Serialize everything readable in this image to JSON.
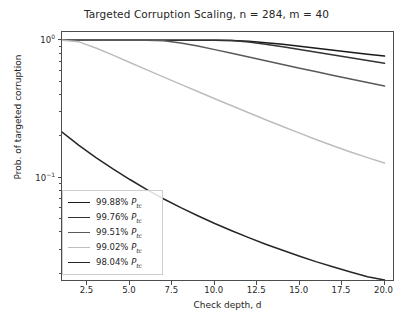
{
  "chart_data": {
    "type": "line",
    "title": "Targeted Corruption Scaling, n = 284, m = 40",
    "xlabel": "Check depth, d",
    "ylabel": "Prob. of targeted corruption",
    "yscale": "log",
    "xscale": "linear",
    "xlim": [
      1.0,
      20.5
    ],
    "ylim": [
      0.018,
      1.15
    ],
    "xticks": [
      "2.5",
      "5.0",
      "7.5",
      "10.0",
      "12.5",
      "15.0",
      "17.5",
      "20.0"
    ],
    "xtick_values": [
      2.5,
      5.0,
      7.5,
      10.0,
      12.5,
      15.0,
      17.5,
      20.0
    ],
    "yticks": [
      "10⁰",
      "10⁻¹"
    ],
    "ytick_values": [
      1.0,
      0.1
    ],
    "grid": false,
    "legend_position": "lower left",
    "x": [
      1,
      2,
      3,
      4,
      5,
      6,
      7,
      8,
      9,
      10,
      11,
      12,
      13,
      14,
      15,
      16,
      17,
      18,
      19,
      20
    ],
    "series": [
      {
        "name": "99.88% P_tc",
        "label": "99.88%",
        "label_symbol": "P",
        "label_sub": "tc",
        "color": "#1a1a1a",
        "values": [
          1.0,
          1.0,
          1.0,
          1.0,
          1.0,
          1.0,
          1.0,
          1.0,
          1.0,
          1.0,
          0.999,
          0.985,
          0.962,
          0.935,
          0.906,
          0.877,
          0.848,
          0.82,
          0.793,
          0.768
        ]
      },
      {
        "name": "99.76% P_tc",
        "label": "99.76%",
        "label_symbol": "P",
        "label_sub": "tc",
        "color": "#333333",
        "values": [
          1.0,
          1.0,
          1.0,
          1.0,
          1.0,
          1.0,
          1.0,
          1.0,
          1.0,
          1.0,
          0.996,
          0.972,
          0.938,
          0.899,
          0.859,
          0.82,
          0.782,
          0.746,
          0.712,
          0.68
        ]
      },
      {
        "name": "99.51% P_tc",
        "label": "99.51%",
        "label_symbol": "P",
        "label_sub": "tc",
        "color": "#595959",
        "values": [
          1.0,
          1.0,
          1.0,
          1.0,
          1.0,
          1.0,
          0.995,
          0.957,
          0.908,
          0.856,
          0.805,
          0.756,
          0.71,
          0.667,
          0.627,
          0.59,
          0.555,
          0.523,
          0.493,
          0.465
        ]
      },
      {
        "name": "99.02% P_tc",
        "label": "99.02%",
        "label_symbol": "P",
        "label_sub": "tc",
        "color": "#bdbdbd",
        "values": [
          1.0,
          0.975,
          0.88,
          0.78,
          0.69,
          0.61,
          0.54,
          0.478,
          0.424,
          0.376,
          0.334,
          0.297,
          0.264,
          0.236,
          0.211,
          0.189,
          0.17,
          0.154,
          0.14,
          0.128
        ]
      },
      {
        "name": "98.04% P_tc",
        "label": "98.04%",
        "label_symbol": "P",
        "label_sub": "tc",
        "color": "#262626",
        "values": [
          0.215,
          0.172,
          0.14,
          0.116,
          0.097,
          0.082,
          0.07,
          0.0605,
          0.0528,
          0.0464,
          0.0411,
          0.0366,
          0.0328,
          0.0296,
          0.0268,
          0.0244,
          0.0224,
          0.0206,
          0.019,
          0.0177
        ]
      }
    ]
  }
}
